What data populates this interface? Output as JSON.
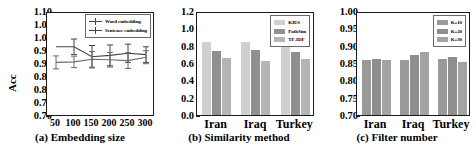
{
  "figure": {
    "panels": [
      "a",
      "b",
      "c"
    ]
  },
  "chart_data": [
    {
      "type": "line",
      "panel": "a",
      "title": "(a) Embedding size",
      "xlabel": "",
      "ylabel": "Acc",
      "categories": [
        "50",
        "100",
        "150",
        "200",
        "250",
        "300"
      ],
      "ylim": [
        0.7,
        1.1
      ],
      "yticks": [
        "1.10",
        "1.05",
        "1.00",
        "0.95",
        "0.90",
        "0.85",
        "0.80",
        "0.75",
        "0.70"
      ],
      "grid": false,
      "legend_position": "top-right",
      "series": [
        {
          "name": "Word embedding",
          "values": [
            0.97,
            0.97,
            0.932,
            0.937,
            0.945,
            0.94
          ],
          "errors": [
            0.0,
            0.03,
            0.043,
            0.04,
            0.035,
            0.03
          ],
          "color": "#444444"
        },
        {
          "name": "Sentence embedding",
          "values": [
            0.91,
            0.912,
            0.922,
            0.92,
            0.917,
            0.93
          ],
          "errors": [
            0.025,
            0.022,
            0.03,
            0.028,
            0.03,
            0.025
          ],
          "color": "#6b6b6b"
        }
      ]
    },
    {
      "type": "bar",
      "panel": "b",
      "title": "(b) Similarity method",
      "xlabel": "",
      "ylabel": "",
      "categories": [
        "Iran",
        "Iraq",
        "Turkey"
      ],
      "ylim": [
        0.0,
        1.2
      ],
      "yticks": [
        "1.2",
        "1.0",
        "0.8",
        "0.6",
        "0.4",
        "0.2",
        "0.0"
      ],
      "grid": false,
      "legend_position": "top-right",
      "series": [
        {
          "name": "KIES",
          "values": [
            0.86,
            0.86,
            0.86
          ],
          "color": "#d0d0d0"
        },
        {
          "name": "PathSim",
          "values": [
            0.75,
            0.76,
            0.74
          ],
          "color": "#909090"
        },
        {
          "name": "TF-IDF",
          "values": [
            0.67,
            0.64,
            0.66
          ],
          "color": "#b5b5b5"
        }
      ]
    },
    {
      "type": "bar",
      "panel": "c",
      "title": "(c) Filter number",
      "xlabel": "",
      "ylabel": "",
      "categories": [
        "Iran",
        "Iraq",
        "Turkey"
      ],
      "ylim": [
        0.7,
        1.0
      ],
      "yticks": [
        "1.00",
        "0.95",
        "0.90",
        "0.85",
        "0.80",
        "0.75",
        "0.70"
      ],
      "grid": false,
      "legend_position": "top-right",
      "series": [
        {
          "name": "K=10",
          "values": [
            0.862,
            0.862,
            0.866
          ],
          "color": "#9a9a9a"
        },
        {
          "name": "K=20",
          "values": [
            0.866,
            0.877,
            0.872
          ],
          "color": "#8e8e8e"
        },
        {
          "name": "K=30",
          "values": [
            0.861,
            0.886,
            0.855
          ],
          "color": "#a3a3a3"
        }
      ]
    }
  ]
}
